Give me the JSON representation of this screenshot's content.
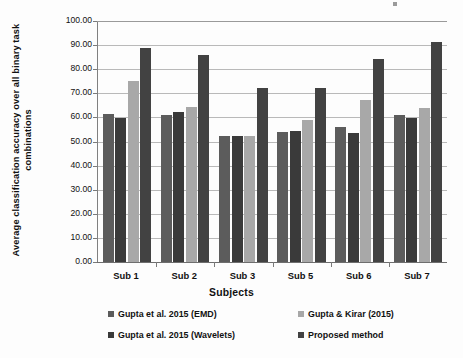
{
  "chart_data": {
    "type": "bar",
    "title": "",
    "xlabel": "Subjects",
    "ylabel": "Average classification accuracy over all binary task combinations",
    "categories": [
      "Sub 1",
      "Sub 2",
      "Sub 3",
      "Sub 5",
      "Sub 6",
      "Sub 7"
    ],
    "series": [
      {
        "name": "Gupta et al. 2015 (EMD)",
        "color": "#5c5c5c",
        "values": [
          61.5,
          61.2,
          52.4,
          53.9,
          56.1,
          61.2
        ]
      },
      {
        "name": "Gupta et al. 2015 (Wavelets)",
        "color": "#3a3a3a",
        "values": [
          59.8,
          62.3,
          52.4,
          54.5,
          53.6,
          59.8
        ]
      },
      {
        "name": "Gupta & Kirar (2015)",
        "color": "#a8a8a8",
        "values": [
          75.3,
          64.3,
          52.1,
          59.0,
          67.2,
          64.0
        ]
      },
      {
        "name": "Proposed method",
        "color": "#424242",
        "values": [
          88.8,
          85.9,
          72.2,
          72.1,
          84.3,
          91.2
        ]
      }
    ],
    "ylim": [
      0,
      100
    ],
    "ytick_step": 10,
    "ytick_labels": [
      "0.00",
      "10.00",
      "20.00",
      "30.00",
      "40.00",
      "50.00",
      "60.00",
      "70.00",
      "80.00",
      "90.00",
      "100.00"
    ],
    "grid": true,
    "legend_position": "bottom",
    "legend": [
      "Gupta et al. 2015 (EMD)",
      "Gupta & Kirar (2015)",
      "Gupta et al. 2015 (Wavelets)",
      "Proposed method"
    ]
  }
}
